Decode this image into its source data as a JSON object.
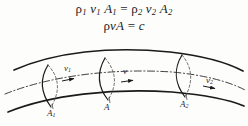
{
  "figure": {
    "background_color": "#fdfdfc",
    "ink_color": "#1b1b1b",
    "equations": {
      "line1_html": "&rho;<sub>1</sub> <i>v</i><sub>1</sub> <i>A</i><sub>1</sub> = &rho;<sub>2</sub> <i>v</i><sub>2</sub> <i>A</i><sub>2</sub>",
      "line1_text": "ρ1 v1 A1 = ρ2 v2 A2",
      "line2_html": "&rho;<i>v</i><i>A</i> = <i>c</i>",
      "line2_text": "ρvA = c"
    },
    "labels": {
      "v1_html": "<i>v</i><sub>1</sub>",
      "v_html": "<i>v</i>",
      "v2_html": "<i>v</i><sub>2</sub>",
      "A1_html": "<i>A</i><sub>1</sub>",
      "A_html": "<i>A</i>",
      "A2_html": "<i>A</i><sub>2</sub>",
      "v1_text": "v1",
      "v_text": "v",
      "v2_text": "v2",
      "A1_text": "A1",
      "A_text": "A",
      "A2_text": "A2"
    },
    "geometry": {
      "top_wall_path": "M 14,70 C 55,52 110,46 170,52 C 205,56 228,63 243,71",
      "bottom_wall_path": "M 8,112 C 50,95 112,88 172,92 C 205,95 230,100 244,106",
      "centerline_path": "M 5,94 C 50,76 112,68 172,72 C 205,75 230,82 245,90",
      "section1_solid": "M 48,65 C 40,78 40,92 51,107",
      "section1_dashed": "M 48,65 C 60,78 60,92 51,107",
      "section_mid_solid": "M 105,58 C 97,72 97,86 108,100",
      "section_mid_dashed": "M 105,58 C 117,72 117,86 108,100",
      "section2_solid": "M 182,55 C 174,68 174,83 185,97",
      "section2_dashed": "M 182,55 C 193,68 193,83 185,97",
      "arrow_v1_at": [
        72,
        78
      ],
      "arrow_v_at": [
        131,
        80
      ],
      "arrow_v2_at": [
        213,
        88
      ]
    }
  }
}
